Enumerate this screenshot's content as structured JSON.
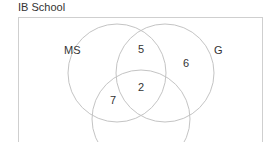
{
  "title": "IB School",
  "sets": [
    {
      "name": "MS",
      "cx": 117,
      "cy": 73,
      "r": 49,
      "label_x": 64,
      "label_y": 54
    },
    {
      "name": "G",
      "cx": 165,
      "cy": 73,
      "r": 49,
      "label_x": 214,
      "label_y": 54
    },
    {
      "name": "",
      "cx": 141,
      "cy": 119,
      "r": 49
    }
  ],
  "regions": [
    {
      "value": "5",
      "x": 138,
      "y": 53
    },
    {
      "value": "6",
      "x": 183,
      "y": 67
    },
    {
      "value": "2",
      "x": 138,
      "y": 91
    },
    {
      "value": "7",
      "x": 110,
      "y": 104
    }
  ],
  "colors": {
    "circle": "#c4c4c4",
    "box": "#cfcfcf",
    "text": "#333333"
  }
}
